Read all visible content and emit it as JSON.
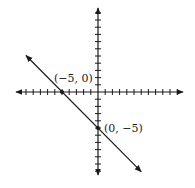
{
  "chart_data": {
    "type": "line",
    "title": "",
    "xlabel": "",
    "ylabel": "",
    "equation": "y = -x - 5",
    "xlim": [
      -11,
      12
    ],
    "ylim": [
      -11.5,
      11.5
    ],
    "grid": false,
    "tick_spacing": 1,
    "series": [
      {
        "name": "line",
        "x": [
          -10,
          6
        ],
        "y": [
          5,
          -11
        ],
        "arrows": "both"
      }
    ],
    "points": [
      {
        "x": -5,
        "y": 0,
        "label": "(−5, 0)"
      },
      {
        "x": 0,
        "y": -5,
        "label": "(0, −5)"
      }
    ]
  },
  "colors": {
    "ink": "#1a1a1a",
    "background": "#ffffff"
  }
}
